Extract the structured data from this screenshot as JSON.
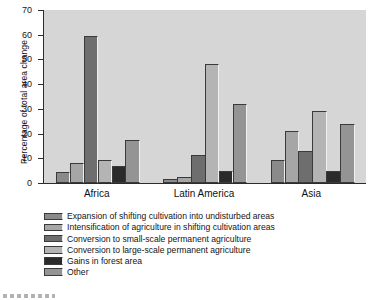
{
  "chart_data": {
    "type": "bar",
    "title": "",
    "xlabel": "",
    "ylabel": "Percentage of total area change",
    "ylim": [
      0,
      70
    ],
    "yticks": [
      0,
      10,
      20,
      30,
      40,
      50,
      60,
      70
    ],
    "grid": false,
    "legend_position": "below-plot",
    "categories": [
      "Africa",
      "Latin America",
      "Asia"
    ],
    "series": [
      {
        "name": "Expansion of shifting cultivation into undisturbed areas",
        "color": "#8a8a8a",
        "values": [
          4.5,
          1.5,
          9.5
        ]
      },
      {
        "name": "Intensification of agriculture in shifting cultivation areas",
        "color": "#a6a6a6",
        "values": [
          8.0,
          2.5,
          21.0
        ]
      },
      {
        "name": "Conversion to small-scale permanent agriculture",
        "color": "#6e6e6e",
        "values": [
          59.5,
          11.5,
          13.0
        ]
      },
      {
        "name": "Conversion to large-scale permanent agriculture",
        "color": "#b4b4b4",
        "values": [
          9.5,
          48.0,
          29.0
        ]
      },
      {
        "name": "Gains in forest area",
        "color": "#2b2b2b",
        "values": [
          7.0,
          4.8,
          5.0
        ]
      },
      {
        "name": "Other",
        "color": "#949494",
        "values": [
          17.5,
          32.0,
          24.0
        ]
      }
    ]
  },
  "axis": {
    "ytick_labels": [
      "0",
      "10",
      "20",
      "30",
      "40",
      "50",
      "60",
      "70"
    ],
    "y_title": "Percentage of total area change"
  },
  "legend": {
    "items": [
      "Expansion of shifting cultivation into undisturbed areas",
      "Intensification of agriculture in shifting cultivation areas",
      "Conversion to small-scale permanent agriculture",
      "Conversion to large-scale permanent agriculture",
      "Gains in forest area",
      "Other"
    ]
  }
}
